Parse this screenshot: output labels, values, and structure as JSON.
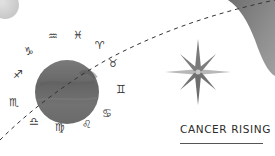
{
  "caption": {
    "text": "CANCER RISING"
  },
  "zodiac_signs": [
    {
      "name": "capricorn",
      "glyph": "♑"
    },
    {
      "name": "aquarius",
      "glyph": "♒"
    },
    {
      "name": "pisces",
      "glyph": "♓"
    },
    {
      "name": "aries",
      "glyph": "♈"
    },
    {
      "name": "taurus",
      "glyph": "♉"
    },
    {
      "name": "gemini",
      "glyph": "♊"
    },
    {
      "name": "cancer",
      "glyph": "♋"
    },
    {
      "name": "leo",
      "glyph": "♌"
    },
    {
      "name": "virgo",
      "glyph": "♍"
    },
    {
      "name": "libra",
      "glyph": "♎"
    },
    {
      "name": "scorpio",
      "glyph": "♏"
    },
    {
      "name": "sagittarius",
      "glyph": "♐"
    }
  ],
  "colors": {
    "planet": "#6e6e6e",
    "small_moon": "#d4d4d4",
    "blob": "#8a8a8a",
    "star_dark": "#777777",
    "star_light": "#b5b5b5",
    "dash": "#333333"
  }
}
